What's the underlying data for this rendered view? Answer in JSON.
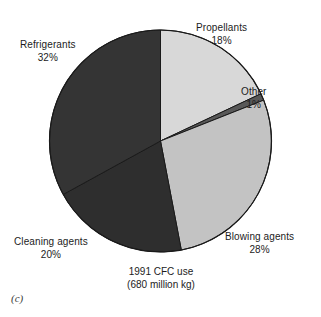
{
  "figure": {
    "letter": "(c)",
    "caption_line1": "1991 CFC use",
    "caption_line2": "(680 million kg)"
  },
  "labels": {
    "propellants": {
      "name": "Propellants",
      "pct": "18%"
    },
    "refrigerants": {
      "name": "Refrigerants",
      "pct": "32%"
    },
    "other": {
      "name": "Other",
      "pct": "1%"
    },
    "blowing": {
      "name": "Blowing agents",
      "pct": "28%"
    },
    "cleaning": {
      "name": "Cleaning agents",
      "pct": "20%"
    }
  },
  "colors": {
    "background": "#ffffff",
    "outline": "#1a1a1a",
    "propellants": "#d8d8d8",
    "other": "#585858",
    "blowing": "#c3c3c3",
    "cleaning": "#2e2e2e",
    "refrigerants": "#343434",
    "text": "#1c1c1c"
  },
  "chart_data": {
    "type": "pie",
    "title": "1991 CFC use (680 million kg)",
    "subtitle": "(680 million kg)",
    "xlabel": "",
    "ylabel": "",
    "total_label": "680 million kg",
    "year": 1991,
    "units": "percent of total CFC use",
    "start_angle_deg": 0,
    "direction": "clockwise",
    "legend": "none (direct labels)",
    "grid": false,
    "categories": [
      "Propellants",
      "Other",
      "Blowing agents",
      "Cleaning agents",
      "Refrigerants"
    ],
    "values": [
      18,
      1,
      28,
      20,
      32
    ],
    "slices": [
      {
        "label": "Propellants",
        "value": 18,
        "color": "#d8d8d8",
        "start_deg": 0.0,
        "end_deg": 64.8
      },
      {
        "label": "Other",
        "value": 1,
        "color": "#585858",
        "start_deg": 64.8,
        "end_deg": 68.4
      },
      {
        "label": "Blowing agents",
        "value": 28,
        "color": "#c3c3c3",
        "start_deg": 68.4,
        "end_deg": 169.2
      },
      {
        "label": "Cleaning agents",
        "value": 20,
        "color": "#2e2e2e",
        "start_deg": 169.2,
        "end_deg": 241.2
      },
      {
        "label": "Refrigerants",
        "value": 32,
        "color": "#343434",
        "start_deg": 241.2,
        "end_deg": 360.0
      }
    ]
  },
  "geometry": {
    "center_x": 160.5,
    "center_y": 141,
    "radius": 111
  }
}
